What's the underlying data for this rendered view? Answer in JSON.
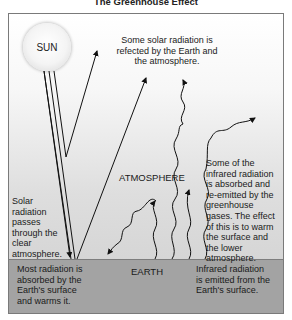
{
  "title": "The Greenhouse Effect",
  "sun_label": "SUN",
  "reflected_text": [
    "Some solar radiation is",
    "refected by the Earth and",
    "the atmosphere."
  ],
  "atmosphere_label": "ATMOSPHERE",
  "solar_pass_text": [
    "Solar",
    "radiation",
    "passes",
    "through the",
    "clear",
    "atmosphere."
  ],
  "absorbed_reemitted_text": [
    "Some of the",
    "infrared radiation",
    "is absorbed and",
    "re-emitted by the",
    "greenhouse",
    "gases. The effect",
    "of this is to warm",
    "the surface and",
    "the lower",
    "atmosphere."
  ],
  "earth_label": "EARTH",
  "surface_absorb_text": [
    "Most radiation is",
    "absorbed by the",
    "Earth's surface",
    "and warms it."
  ],
  "infrared_emit_text": [
    "Infrared radiation",
    "is emitted from the",
    "Earth's surface."
  ],
  "colors": {
    "earth": "#a3a3a3",
    "atmosphere_top": "#ffffff",
    "atmosphere_bottom": "#cfcfcf",
    "line": "#111111",
    "frame": "#7a7a7a"
  }
}
